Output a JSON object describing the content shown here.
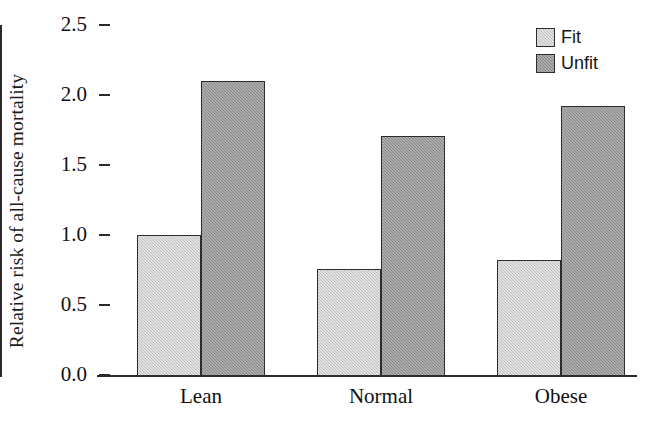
{
  "chart_data": {
    "type": "bar",
    "title": "",
    "xlabel": "",
    "ylabel": "Relative risk of all-cause mortality",
    "categories": [
      "Lean",
      "Normal",
      "Obese"
    ],
    "series": [
      {
        "name": "Fit",
        "color": "#c6c6c6",
        "values": [
          1.0,
          0.76,
          0.82
        ]
      },
      {
        "name": "Unfit",
        "color": "#8e8e8e",
        "values": [
          2.1,
          1.71,
          1.92
        ]
      }
    ],
    "ylim": [
      0.0,
      2.5
    ],
    "ytick_labels": [
      "0.0",
      "0.5",
      "1.0",
      "1.5",
      "2.0",
      "2.5"
    ],
    "ytick_values": [
      0.0,
      0.5,
      1.0,
      1.5,
      2.0,
      2.5
    ],
    "grid": false,
    "legend_position": "top-right",
    "legend_entries": [
      "Fit",
      "Unfit"
    ],
    "annotations": []
  },
  "axis": {
    "y_title": "Relative risk of all-cause mortality"
  },
  "legend": {
    "items": [
      {
        "label": "Fit"
      },
      {
        "label": "Unfit"
      }
    ]
  }
}
